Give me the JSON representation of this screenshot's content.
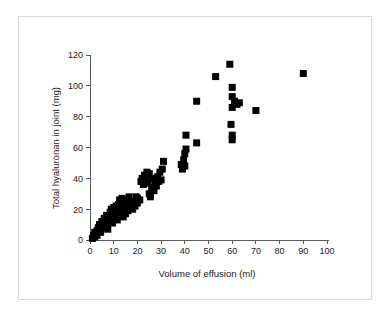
{
  "figure": {
    "background_color": "#ffffff",
    "frame_color": "#d8d8d8",
    "axis_color": "#5a5a5a",
    "marker_color": "#000000"
  },
  "chart_data": {
    "type": "scatter",
    "title": "",
    "xlabel": "Volume of effusion (ml)",
    "ylabel": "Total hyaluronan in joint (mg)",
    "xlim": [
      0,
      100
    ],
    "ylim": [
      0,
      120
    ],
    "xticks": [
      0,
      10,
      20,
      30,
      40,
      50,
      60,
      70,
      80,
      90,
      100
    ],
    "yticks": [
      0,
      20,
      40,
      60,
      80,
      100,
      120
    ],
    "xticklabels": [
      "0",
      "10",
      "20",
      "30",
      "40",
      "50",
      "60",
      "70",
      "80",
      "90",
      "100"
    ],
    "yticklabels": [
      "0",
      "20",
      "40",
      "60",
      "80",
      "100",
      "120"
    ],
    "grid": false,
    "legend": null,
    "marker": "square",
    "marker_size": 7,
    "series": [
      {
        "name": "patients",
        "points": [
          [
            1,
            1
          ],
          [
            1.5,
            3
          ],
          [
            2,
            2
          ],
          [
            2,
            5
          ],
          [
            2.5,
            4
          ],
          [
            3,
            6
          ],
          [
            3,
            3
          ],
          [
            3.5,
            8
          ],
          [
            4,
            7
          ],
          [
            4,
            10
          ],
          [
            4.5,
            5
          ],
          [
            5,
            9
          ],
          [
            5,
            12
          ],
          [
            5.5,
            11
          ],
          [
            6,
            8
          ],
          [
            6,
            14
          ],
          [
            6.5,
            10
          ],
          [
            7,
            13
          ],
          [
            7,
            16
          ],
          [
            7.5,
            7
          ],
          [
            8,
            12
          ],
          [
            8,
            15
          ],
          [
            8.5,
            18
          ],
          [
            9,
            14
          ],
          [
            9,
            20
          ],
          [
            9.5,
            11
          ],
          [
            10,
            17
          ],
          [
            10,
            21
          ],
          [
            11,
            16
          ],
          [
            11,
            22
          ],
          [
            11.5,
            13
          ],
          [
            12,
            19
          ],
          [
            12,
            23
          ],
          [
            12.5,
            26
          ],
          [
            13,
            18
          ],
          [
            13,
            21
          ],
          [
            13.5,
            27
          ],
          [
            14,
            15
          ],
          [
            14,
            20
          ],
          [
            14.5,
            24
          ],
          [
            15,
            17
          ],
          [
            15,
            22
          ],
          [
            15.5,
            26
          ],
          [
            16,
            19
          ],
          [
            16,
            23
          ],
          [
            16.5,
            28
          ],
          [
            17,
            21
          ],
          [
            17.5,
            24
          ],
          [
            18,
            20
          ],
          [
            18,
            25
          ],
          [
            19,
            22
          ],
          [
            19.5,
            28
          ],
          [
            20,
            24
          ],
          [
            20,
            27
          ],
          [
            21,
            26
          ],
          [
            21.5,
            38
          ],
          [
            22,
            40
          ],
          [
            22.5,
            36
          ],
          [
            23,
            42
          ],
          [
            23.5,
            39
          ],
          [
            24,
            41
          ],
          [
            24,
            44
          ],
          [
            24.5,
            37
          ],
          [
            25,
            30
          ],
          [
            25,
            43
          ],
          [
            25.5,
            28
          ],
          [
            26,
            34
          ],
          [
            26,
            40
          ],
          [
            27,
            32
          ],
          [
            27.5,
            37
          ],
          [
            28,
            35
          ],
          [
            28.5,
            41
          ],
          [
            29,
            38
          ],
          [
            29.5,
            44
          ],
          [
            30,
            39
          ],
          [
            30.5,
            46
          ],
          [
            31,
            51
          ],
          [
            38.5,
            49
          ],
          [
            39,
            46
          ],
          [
            39.5,
            52
          ],
          [
            40,
            48
          ],
          [
            40,
            56
          ],
          [
            40.5,
            59
          ],
          [
            40.5,
            68
          ],
          [
            45,
            63
          ],
          [
            45,
            90
          ],
          [
            53,
            106
          ],
          [
            59,
            114
          ],
          [
            59.5,
            75
          ],
          [
            60,
            93
          ],
          [
            60,
            99
          ],
          [
            60,
            86
          ],
          [
            60,
            68
          ],
          [
            60,
            65
          ],
          [
            61,
            90
          ],
          [
            62,
            88
          ],
          [
            63,
            89
          ],
          [
            70,
            84
          ],
          [
            90,
            108
          ]
        ]
      }
    ]
  }
}
